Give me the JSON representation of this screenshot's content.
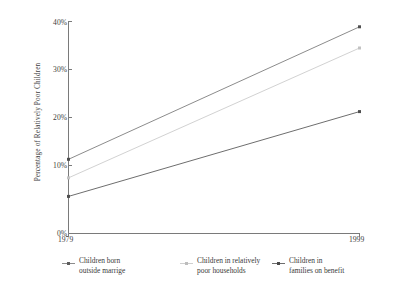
{
  "chart_data": {
    "type": "line",
    "title": "",
    "xlabel": "",
    "ylabel": "Percentage of Relatively Poor Children",
    "x": [
      1979,
      1999
    ],
    "xticklabels": [
      "1979",
      "1999"
    ],
    "xlim": [
      1979,
      1999
    ],
    "ylim": [
      0,
      40
    ],
    "yticks": [
      0,
      10,
      20,
      30,
      40
    ],
    "yticklabels": [
      "0%",
      "10%",
      "20%",
      "30%",
      "40%"
    ],
    "grid": false,
    "legend_position": "below",
    "series": [
      {
        "name": "Children born outside marrige",
        "values": [
          14,
          39
        ],
        "color": "#8c8c8c",
        "marker": "square"
      },
      {
        "name": "Children in relatively poor households",
        "values": [
          10.5,
          35
        ],
        "color": "#d2d2d2",
        "marker": "square"
      },
      {
        "name": "Children in families on benefit",
        "values": [
          7,
          23
        ],
        "color": "#6e6e6e",
        "marker": "square"
      }
    ]
  },
  "axes": {
    "y_title": "Percentage of Relatively Poor Children",
    "y_ticks": [
      {
        "label": "40%",
        "value": 40
      },
      {
        "label": "30%",
        "value": 30
      },
      {
        "label": "20%",
        "value": 20
      },
      {
        "label": "10%",
        "value": 10
      },
      {
        "label": "0%",
        "value": 0
      }
    ],
    "x_ticks": [
      {
        "label": "1979",
        "value": 1979
      },
      {
        "label": "1999",
        "value": 1999
      }
    ],
    "axis_color": "#7a7a7a"
  },
  "legend": {
    "items": [
      {
        "label": "Children born\noutside marrige",
        "line1": "Children born",
        "line2": "outside marrige",
        "color": "#8c8c8c",
        "marker_icon": "line-marker-icon"
      },
      {
        "label": "Children in relatively\npoor households",
        "line1": "Children in relatively",
        "line2": "poor households",
        "color": "#d2d2d2",
        "marker_icon": "line-marker-icon"
      },
      {
        "label": "Children in\nfamilies on benefit",
        "line1": "Children in",
        "line2": "families on benefit",
        "color": "#6e6e6e",
        "marker_icon": "line-marker-icon"
      }
    ]
  },
  "colors": {
    "background": "#ffffff",
    "text": "#3a3a3a",
    "series_1": "#8c8c8c",
    "series_2": "#d2d2d2",
    "series_3": "#6e6e6e"
  }
}
